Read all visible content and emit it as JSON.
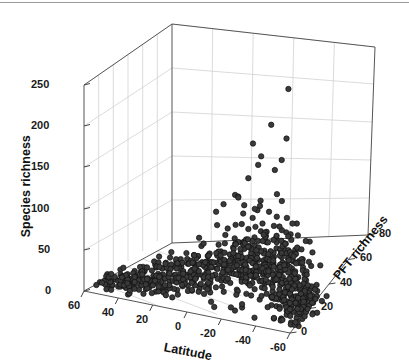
{
  "chart_data": {
    "type": "scatter",
    "projection": "3d",
    "title": "",
    "xlabel": "Latitude",
    "ylabel": "PFT richness",
    "zlabel": "Species richness",
    "xlim": [
      70,
      -70
    ],
    "ylim": [
      0,
      80
    ],
    "zlim": [
      0,
      260
    ],
    "xticks": [
      60,
      40,
      20,
      0,
      -20,
      -40,
      -60
    ],
    "xticklabels": [
      "60",
      "40",
      "20",
      "0",
      "-20",
      "-40",
      "-60"
    ],
    "yticks": [
      0,
      20,
      40,
      60,
      80
    ],
    "yticklabels": [
      "0",
      "20",
      "40",
      "60",
      "80"
    ],
    "zticks": [
      0,
      50,
      100,
      150,
      200,
      250
    ],
    "zticklabels": [
      "0",
      "50",
      "100",
      "150",
      "200",
      "250"
    ],
    "grid": true,
    "legend": null,
    "marker": {
      "shape": "circle",
      "size": 5.4,
      "facecolor": "#3a3a3a",
      "edgecolor": "#101010",
      "filled": true
    },
    "box_color": "#4d4d4d",
    "grid_color": "#cfcfcf",
    "background": "#ffffff",
    "n_points": 612,
    "points": [
      [
        62,
        18,
        4
      ],
      [
        61,
        12,
        3
      ],
      [
        60,
        22,
        6
      ],
      [
        59,
        9,
        5
      ],
      [
        58,
        30,
        7
      ],
      [
        57,
        15,
        4
      ],
      [
        56,
        26,
        8
      ],
      [
        55,
        11,
        3
      ],
      [
        54,
        35,
        9
      ],
      [
        53,
        20,
        6
      ],
      [
        52,
        14,
        5
      ],
      [
        51,
        28,
        10
      ],
      [
        50,
        38,
        12
      ],
      [
        49,
        17,
        6
      ],
      [
        48,
        24,
        8
      ],
      [
        47,
        31,
        11
      ],
      [
        46,
        13,
        4
      ],
      [
        45,
        41,
        14
      ],
      [
        44,
        19,
        7
      ],
      [
        43,
        27,
        9
      ],
      [
        42,
        36,
        13
      ],
      [
        41,
        22,
        8
      ],
      [
        40,
        44,
        16
      ],
      [
        39,
        16,
        6
      ],
      [
        38,
        29,
        11
      ],
      [
        37,
        33,
        12
      ],
      [
        36,
        21,
        9
      ],
      [
        35,
        47,
        18
      ],
      [
        34,
        25,
        10
      ],
      [
        33,
        39,
        15
      ],
      [
        32,
        18,
        7
      ],
      [
        31,
        30,
        12
      ],
      [
        30,
        50,
        21
      ],
      [
        29,
        23,
        10
      ],
      [
        28,
        34,
        14
      ],
      [
        27,
        43,
        18
      ],
      [
        26,
        19,
        8
      ],
      [
        25,
        27,
        12
      ],
      [
        24,
        52,
        24
      ],
      [
        23,
        31,
        14
      ],
      [
        22,
        38,
        17
      ],
      [
        21,
        24,
        11
      ],
      [
        20,
        46,
        22
      ],
      [
        19,
        29,
        13
      ],
      [
        18,
        55,
        28
      ],
      [
        17,
        33,
        16
      ],
      [
        16,
        41,
        21
      ],
      [
        15,
        26,
        12
      ],
      [
        14,
        49,
        26
      ],
      [
        13,
        36,
        19
      ],
      [
        12,
        58,
        33
      ],
      [
        11,
        30,
        15
      ],
      [
        10,
        44,
        24
      ],
      [
        9,
        39,
        22
      ],
      [
        8,
        61,
        38
      ],
      [
        7,
        34,
        18
      ],
      [
        6,
        52,
        30
      ],
      [
        5,
        28,
        14
      ],
      [
        4,
        47,
        27
      ],
      [
        3,
        56,
        36
      ],
      [
        2,
        64,
        45
      ],
      [
        1,
        37,
        21
      ],
      [
        0,
        50,
        31
      ],
      [
        -1,
        42,
        25
      ],
      [
        -2,
        59,
        40
      ],
      [
        -3,
        33,
        18
      ],
      [
        -4,
        67,
        52
      ],
      [
        -5,
        45,
        27
      ],
      [
        -6,
        54,
        34
      ],
      [
        -7,
        38,
        21
      ],
      [
        -8,
        62,
        44
      ],
      [
        -9,
        48,
        29
      ],
      [
        -10,
        57,
        38
      ],
      [
        -11,
        35,
        19
      ],
      [
        -12,
        65,
        49
      ],
      [
        -13,
        43,
        25
      ],
      [
        -14,
        51,
        32
      ],
      [
        -15,
        39,
        22
      ],
      [
        -16,
        60,
        41
      ],
      [
        -17,
        46,
        28
      ],
      [
        -18,
        55,
        35
      ],
      [
        -19,
        34,
        18
      ],
      [
        -20,
        63,
        46
      ],
      [
        -21,
        41,
        24
      ],
      [
        -22,
        49,
        30
      ],
      [
        -23,
        37,
        20
      ],
      [
        -24,
        58,
        39
      ],
      [
        -25,
        44,
        26
      ],
      [
        -26,
        52,
        33
      ],
      [
        -27,
        32,
        17
      ],
      [
        -28,
        61,
        43
      ],
      [
        -29,
        40,
        23
      ],
      [
        -30,
        47,
        28
      ],
      [
        -31,
        36,
        19
      ],
      [
        -32,
        54,
        35
      ],
      [
        -33,
        43,
        24
      ],
      [
        -34,
        50,
        30
      ],
      [
        -35,
        31,
        16
      ],
      [
        -36,
        57,
        37
      ],
      [
        -37,
        38,
        21
      ],
      [
        -38,
        45,
        26
      ],
      [
        -39,
        29,
        15
      ],
      [
        -40,
        52,
        32
      ],
      [
        -41,
        35,
        18
      ],
      [
        -42,
        42,
        23
      ],
      [
        -43,
        27,
        13
      ],
      [
        -44,
        48,
        28
      ],
      [
        -45,
        33,
        17
      ],
      [
        -46,
        39,
        21
      ],
      [
        -47,
        25,
        12
      ],
      [
        -48,
        44,
        25
      ],
      [
        -49,
        30,
        15
      ],
      [
        -50,
        36,
        19
      ],
      [
        -51,
        22,
        11
      ],
      [
        -52,
        40,
        22
      ],
      [
        -53,
        28,
        14
      ],
      [
        -54,
        33,
        17
      ],
      [
        -55,
        20,
        10
      ],
      [
        -56,
        36,
        19
      ],
      [
        -57,
        25,
        12
      ],
      [
        -58,
        30,
        15
      ],
      [
        -59,
        18,
        9
      ],
      [
        -60,
        32,
        16
      ],
      [
        -61,
        23,
        11
      ],
      [
        -62,
        27,
        13
      ],
      [
        -63,
        16,
        8
      ],
      [
        -64,
        29,
        14
      ],
      [
        -65,
        21,
        10
      ]
    ]
  },
  "axes": {
    "x_title": "Latitude",
    "y_title": "PFT richness",
    "z_title": "Species richness"
  },
  "ticks": {
    "z": [
      "250",
      "200",
      "150",
      "100",
      "50",
      "0"
    ],
    "x": [
      "60",
      "40",
      "20",
      "0",
      "-20",
      "-40",
      "-60"
    ],
    "y": [
      "80",
      "60",
      "40",
      "20",
      "0"
    ]
  }
}
